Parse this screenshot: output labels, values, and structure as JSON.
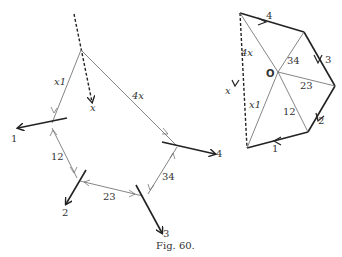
{
  "caption": "Fig. 60.",
  "left_figure": {
    "labels": {
      "x": "x",
      "x1": "x1",
      "x4": "4x",
      "f1": "1",
      "f2": "2",
      "f3": "3",
      "f4": "4",
      "b12": "12",
      "b23": "23",
      "b34": "34"
    }
  },
  "right_figure": {
    "labels": {
      "origin": "O",
      "s4": "4",
      "s3": "3",
      "s2": "2",
      "s1": "1",
      "r4x": "4x",
      "rx1": "x1",
      "rx": "x",
      "r34": "34",
      "r23": "23",
      "r12": "12"
    }
  },
  "colors": {
    "line": "#555555",
    "bold": "#222222"
  }
}
